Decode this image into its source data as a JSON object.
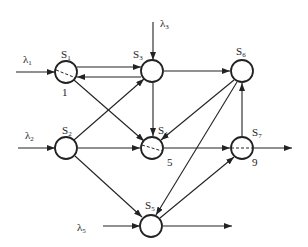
{
  "diagram": {
    "type": "directed-network",
    "nodes": [
      {
        "id": "S1",
        "label": "S",
        "sub": "1",
        "x": 66,
        "y": 72,
        "dashed": true,
        "number": "1"
      },
      {
        "id": "S3",
        "label": "S",
        "sub": "3",
        "x": 152,
        "y": 71,
        "dashed": false,
        "number": ""
      },
      {
        "id": "S6",
        "label": "S",
        "sub": "6",
        "x": 242,
        "y": 71,
        "dashed": false,
        "number": ""
      },
      {
        "id": "S2",
        "label": "S",
        "sub": "2",
        "x": 66,
        "y": 148,
        "dashed": false,
        "number": ""
      },
      {
        "id": "S4",
        "label": "S",
        "sub": "4",
        "x": 152,
        "y": 148,
        "dashed": true,
        "number": "5"
      },
      {
        "id": "S7",
        "label": "S",
        "sub": "7",
        "x": 242,
        "y": 148,
        "dashed": true,
        "number": "9"
      },
      {
        "id": "S5",
        "label": "S",
        "sub": "5",
        "x": 151,
        "y": 226,
        "dashed": false,
        "number": ""
      }
    ],
    "inputs": [
      {
        "id": "lambda1",
        "label": "λ",
        "sub": "1",
        "target": "S1"
      },
      {
        "id": "lambda2",
        "label": "λ",
        "sub": "2",
        "target": "S2"
      },
      {
        "id": "lambda3",
        "label": "λ",
        "sub": "3",
        "target": "S3"
      },
      {
        "id": "lambda5",
        "label": "λ",
        "sub": "5",
        "target": "S5"
      }
    ],
    "edges": [
      [
        "S1",
        "S3"
      ],
      [
        "S3",
        "S1"
      ],
      [
        "S1",
        "S4"
      ],
      [
        "S3",
        "S6"
      ],
      [
        "S3",
        "S4"
      ],
      [
        "S2",
        "S3"
      ],
      [
        "S2",
        "S4"
      ],
      [
        "S2",
        "S5"
      ],
      [
        "S6",
        "S4"
      ],
      [
        "S6",
        "S5"
      ],
      [
        "S4",
        "S7"
      ],
      [
        "S7",
        "S6"
      ],
      [
        "S5",
        "S7"
      ]
    ],
    "outputs": [
      {
        "from": "S7"
      },
      {
        "from": "S5"
      }
    ]
  }
}
